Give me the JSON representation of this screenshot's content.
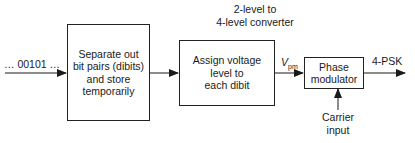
{
  "input_signal": "… 00101 …",
  "blocks": [
    {
      "id": "separator",
      "lines": [
        "Separate out",
        "bit pairs (dibits)",
        "and store",
        "temporarily"
      ]
    },
    {
      "id": "converter",
      "lines": [
        "Assign voltage",
        "level to",
        "each dibit"
      ]
    },
    {
      "id": "phase_modulator",
      "lines": [
        "Phase",
        "modulator"
      ]
    }
  ],
  "converter_caption": [
    "2-level to",
    "4-level converter"
  ],
  "signal_label": {
    "main": "V",
    "subscript": "pm"
  },
  "output_label": "4-PSK",
  "carrier_label": [
    "Carrier",
    "input"
  ]
}
